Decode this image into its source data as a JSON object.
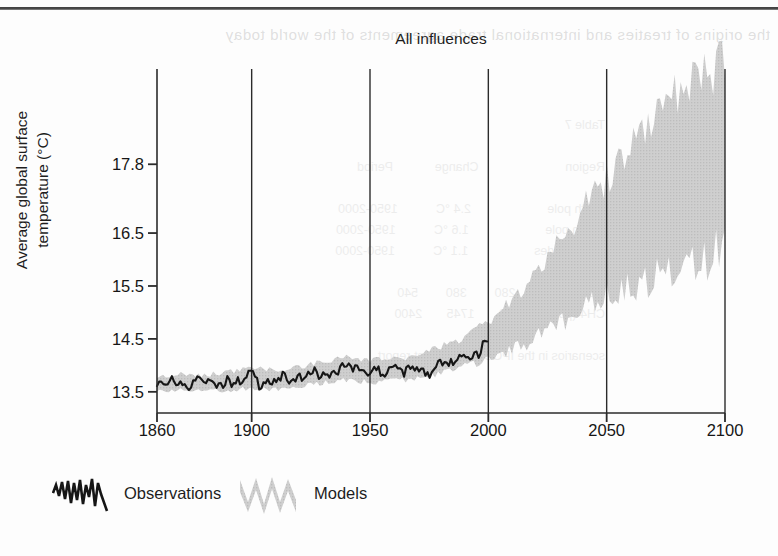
{
  "page": {
    "bleed_text_top": "the origins of treaties and international trade agreements of the world today",
    "bleed_text_block": "Table 7\n\nRegion                         Change            Period\n\nNorth pole                      2.4 °C           1950-2000\nSouth pole                      1.6 °C           1950-2000\nmid-latitudes                   1.1 °C           1950-2000\n\nCO2 (ppm)        280        380        540\nCH4 (ppb)        700       1745       2400\n\nscenarios in the IPCC assessment report"
  },
  "chart": {
    "title": "All influences",
    "y_axis_title_line1": "Average global surface",
    "y_axis_title_line2": "temperature (°C)",
    "legend": {
      "observations_label": "Observations",
      "models_label": "Models"
    },
    "colors": {
      "observations_line": "#161616",
      "models_band": "#c9c9c9",
      "axis": "#2b2b2b",
      "background": "#fdfdfd"
    }
  },
  "chart_data": {
    "type": "line",
    "title": "All influences",
    "xlabel": "",
    "ylabel": "Average global surface temperature (°C)",
    "xlim": [
      1860,
      2100
    ],
    "ylim": [
      13.1,
      19.6
    ],
    "grid": false,
    "legend_position": "below-axes-left",
    "x_ticks": [
      1860,
      1900,
      1950,
      2000,
      2050,
      2100
    ],
    "y_ticks": [
      13.5,
      14.5,
      15.5,
      16.5,
      17.8
    ],
    "x_gridlines": [
      1900,
      1950,
      2000,
      2050,
      2100
    ],
    "series": [
      {
        "name": "Observations",
        "type": "line",
        "color": "#161616",
        "x_range": [
          1860,
          2000
        ],
        "x": [
          1860,
          1862,
          1864,
          1866,
          1868,
          1870,
          1872,
          1874,
          1876,
          1878,
          1880,
          1882,
          1884,
          1886,
          1888,
          1890,
          1892,
          1894,
          1896,
          1898,
          1900,
          1902,
          1904,
          1906,
          1908,
          1910,
          1912,
          1914,
          1916,
          1918,
          1920,
          1922,
          1924,
          1926,
          1928,
          1930,
          1932,
          1934,
          1936,
          1938,
          1940,
          1942,
          1944,
          1946,
          1948,
          1950,
          1952,
          1954,
          1956,
          1958,
          1960,
          1962,
          1964,
          1966,
          1968,
          1970,
          1972,
          1974,
          1976,
          1978,
          1980,
          1982,
          1984,
          1986,
          1988,
          1990,
          1992,
          1994,
          1996,
          1998,
          2000
        ],
        "values": [
          13.62,
          13.7,
          13.58,
          13.73,
          13.63,
          13.76,
          13.64,
          13.57,
          13.72,
          13.85,
          13.66,
          13.74,
          13.6,
          13.69,
          13.63,
          13.78,
          13.62,
          13.7,
          13.66,
          13.8,
          13.93,
          13.71,
          13.6,
          13.74,
          13.63,
          13.68,
          13.75,
          13.82,
          13.67,
          13.72,
          13.8,
          13.74,
          13.83,
          13.9,
          13.79,
          13.88,
          13.82,
          13.94,
          13.87,
          13.98,
          14.02,
          13.93,
          14.05,
          13.92,
          13.88,
          13.82,
          13.95,
          13.86,
          13.76,
          13.97,
          13.9,
          13.99,
          13.84,
          13.96,
          13.89,
          14.0,
          13.95,
          13.87,
          13.82,
          13.99,
          14.08,
          13.97,
          14.06,
          14.01,
          14.18,
          14.22,
          14.1,
          14.24,
          14.17,
          14.48,
          14.33
        ]
      },
      {
        "name": "Models",
        "type": "band",
        "color": "#c9c9c9",
        "x_range": [
          1860,
          2100
        ],
        "x": [
          1860,
          1870,
          1880,
          1890,
          1900,
          1910,
          1920,
          1930,
          1940,
          1950,
          1960,
          1970,
          1980,
          1990,
          2000,
          2010,
          2020,
          2030,
          2040,
          2050,
          2060,
          2070,
          2080,
          2090,
          2100
        ],
        "lower": [
          13.52,
          13.54,
          13.53,
          13.55,
          13.58,
          13.57,
          13.62,
          13.68,
          13.74,
          13.7,
          13.72,
          13.78,
          13.88,
          14.0,
          14.15,
          14.32,
          14.55,
          14.82,
          15.1,
          15.38,
          15.6,
          15.82,
          16.0,
          16.15,
          16.3
        ],
        "upper": [
          13.78,
          13.82,
          13.8,
          13.86,
          13.92,
          13.9,
          13.96,
          14.04,
          14.14,
          14.08,
          14.1,
          14.18,
          14.32,
          14.52,
          14.78,
          15.2,
          15.7,
          16.25,
          16.85,
          17.45,
          18.0,
          18.5,
          18.95,
          19.25,
          19.55
        ]
      }
    ]
  }
}
